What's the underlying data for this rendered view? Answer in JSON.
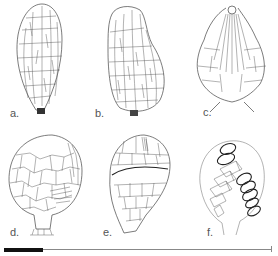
{
  "figure": {
    "panels": [
      {
        "id": "a",
        "label": "a.",
        "description": "elongate ovoid capsule with longitudinal elongate cell network"
      },
      {
        "id": "b",
        "label": "b.",
        "description": "pyriform capsule, asymmetric, with irregular cell network"
      },
      {
        "id": "c",
        "label": "c.",
        "description": "capsule with apical pore and radiating elongate cells"
      },
      {
        "id": "d",
        "label": "d.",
        "description": "globose capsule with polygonal cell network on short stalk"
      },
      {
        "id": "e",
        "label": "e.",
        "description": "globose capsule with transverse dehiscence line"
      },
      {
        "id": "f",
        "label": "f.",
        "description": "outline with rows of annulus/operculum cells"
      }
    ],
    "scale_bar": {
      "filled_fraction": 0.145,
      "color_fill": "#111111",
      "color_line": "#888888"
    }
  }
}
